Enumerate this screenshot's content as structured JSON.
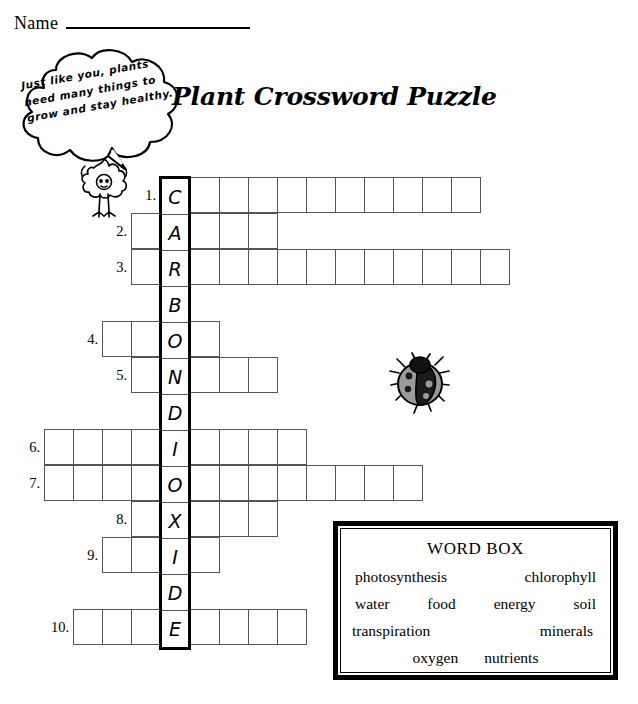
{
  "worksheet": {
    "name_label": "Name",
    "title": "Plant Crossword Puzzle",
    "bubble_text": "Just like you, plants need many things to grow and stay healthy."
  },
  "icons": {
    "sprout": "sprout-character-icon",
    "ladybug": "ladybug-icon",
    "bubble": "speech-bubble-icon"
  },
  "crossword": {
    "spine_word": "CARBONDIOXIDE",
    "spine_letters": [
      "C",
      "A",
      "R",
      "B",
      "O",
      "N",
      "D",
      "I",
      "O",
      "X",
      "I",
      "D",
      "E"
    ],
    "cell_size": 30,
    "rows": [
      {
        "number": "1.",
        "letter": "C",
        "left": 0,
        "right": 10,
        "length": 11
      },
      {
        "number": "2.",
        "letter": "A",
        "left": 1,
        "right": 3,
        "length": 5
      },
      {
        "number": "3.",
        "letter": "R",
        "left": 1,
        "right": 11,
        "length": 13
      },
      {
        "number": "4.",
        "letter": "O",
        "left": 2,
        "right": 1,
        "length": 4
      },
      {
        "number": "5.",
        "letter": "N",
        "left": 1,
        "right": 3,
        "length": 5
      },
      {
        "number": "6.",
        "letter": "I",
        "left": 4,
        "right": 4,
        "length": 9
      },
      {
        "number": "7.",
        "letter": "O",
        "left": 4,
        "right": 8,
        "length": 13
      },
      {
        "number": "8.",
        "letter": "X",
        "left": 1,
        "right": 3,
        "length": 5
      },
      {
        "number": "9.",
        "letter": "I",
        "left": 2,
        "right": 1,
        "length": 4
      },
      {
        "number": "10.",
        "letter": "E",
        "left": 3,
        "right": 4,
        "length": 8
      }
    ],
    "blank_spine_letters": [
      "B",
      "D",
      "D"
    ]
  },
  "word_box": {
    "title": "WORD BOX",
    "lines": [
      [
        "photosynthesis",
        "chlorophyll"
      ],
      [
        "water",
        "food",
        "energy",
        "soil"
      ],
      [
        "transpiration",
        "minerals"
      ],
      [
        "oxygen",
        "nutrients"
      ]
    ]
  },
  "colors": {
    "ink": "#000000",
    "grid_line": "#555555",
    "paper": "#ffffff",
    "ladybug_wing": "#9a9a9a"
  }
}
